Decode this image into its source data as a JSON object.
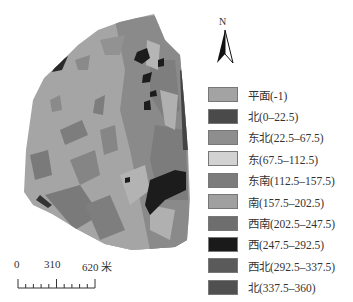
{
  "north_arrow": {
    "label": "N"
  },
  "legend": {
    "items": [
      {
        "label": "平面(-1)",
        "color": "#a3a3a3"
      },
      {
        "label": "北(0–22.5)",
        "color": "#4a4a4a"
      },
      {
        "label": "东北(22.5–67.5)",
        "color": "#8e8e8e"
      },
      {
        "label": "东(67.5–112.5)",
        "color": "#d2d2d2"
      },
      {
        "label": "东南(112.5–157.5)",
        "color": "#7c7c7c"
      },
      {
        "label": "南(157.5–202.5)",
        "color": "#a0a0a0"
      },
      {
        "label": "西南(202.5–247.5)",
        "color": "#6e6e6e"
      },
      {
        "label": "西(247.5–292.5)",
        "color": "#1a1a1a"
      },
      {
        "label": "西北(292.5–337.5)",
        "color": "#5a5a5a"
      },
      {
        "label": "北(337.5–360)",
        "color": "#505050"
      }
    ]
  },
  "scale_bar": {
    "labels": [
      "0",
      "310",
      "620 米"
    ]
  },
  "map": {
    "base_color": "#a5a5a5",
    "patch_colors": {
      "medium": "#8a8a8a",
      "darkgray": "#6c6c6c",
      "dark": "#1c1c1c",
      "light": "#c4c4c4"
    }
  }
}
